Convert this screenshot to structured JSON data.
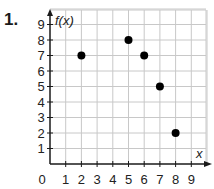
{
  "problem": {
    "number": "1."
  },
  "chart_data": {
    "type": "scatter",
    "title": "",
    "xlabel": "x",
    "ylabel": "f(x)",
    "x_ticks": [
      "0",
      "1",
      "2",
      "3",
      "4",
      "5",
      "6",
      "7",
      "8",
      "9"
    ],
    "y_ticks": [
      "1",
      "2",
      "3",
      "4",
      "5",
      "6",
      "7",
      "8",
      "9"
    ],
    "xlim": [
      0,
      9
    ],
    "ylim": [
      0,
      9
    ],
    "grid": true,
    "points": [
      {
        "x": 2,
        "y": 7
      },
      {
        "x": 5,
        "y": 8
      },
      {
        "x": 6,
        "y": 7
      },
      {
        "x": 7,
        "y": 5
      },
      {
        "x": 8,
        "y": 2
      }
    ],
    "colors": {
      "grid": "#c8c8c8",
      "axis": "#1a1a1a",
      "point": "#000000"
    }
  }
}
